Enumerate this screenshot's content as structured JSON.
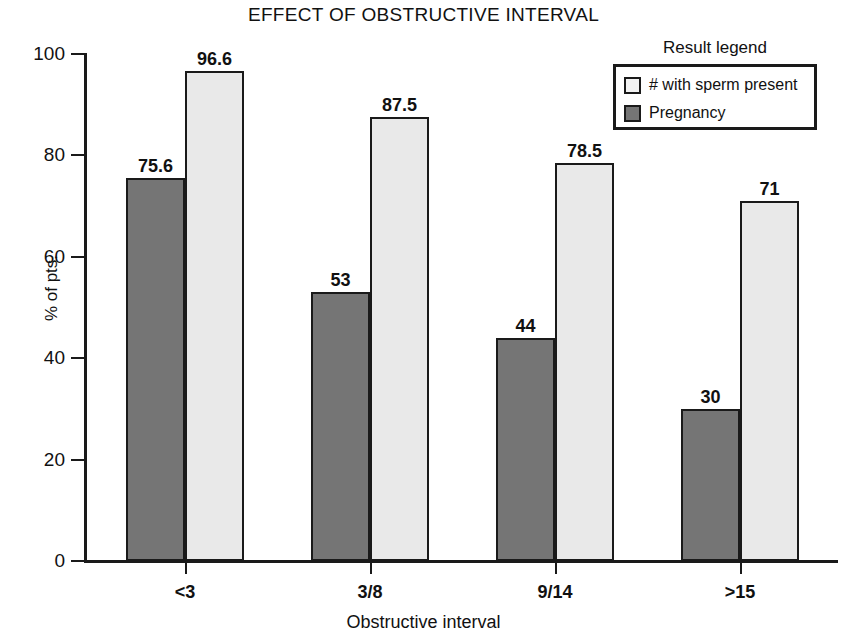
{
  "chart_data": {
    "type": "bar",
    "title": "EFFECT OF OBSTRUCTIVE INTERVAL",
    "xlabel": "Obstructive interval",
    "ylabel": "% of pts.",
    "categories": [
      "<3",
      "3/8",
      "9/14",
      ">15"
    ],
    "ylim": [
      0,
      100
    ],
    "yticks": [
      0,
      20,
      40,
      60,
      80,
      100
    ],
    "ytick_labels": [
      "0",
      "20",
      "40",
      "60",
      "80",
      "100"
    ],
    "grid": false,
    "legend_position": "top-right",
    "legend_title": "Result legend",
    "series": [
      {
        "name": "Pregnancy",
        "color": "#757575",
        "values": [
          75.6,
          53,
          44,
          30
        ],
        "value_labels": [
          "75.6",
          "53",
          "44",
          "30"
        ]
      },
      {
        "name": "# with sperm present",
        "color": "#e9e9e9",
        "values": [
          96.6,
          87.5,
          78.5,
          71
        ],
        "value_labels": [
          "96.6",
          "87.5",
          "78.5",
          "71"
        ]
      }
    ]
  },
  "legend": {
    "title": "Result legend",
    "entries": [
      {
        "label": "# with sperm present",
        "swatch": "light"
      },
      {
        "label": "Pregnancy",
        "swatch": "dark"
      }
    ]
  }
}
